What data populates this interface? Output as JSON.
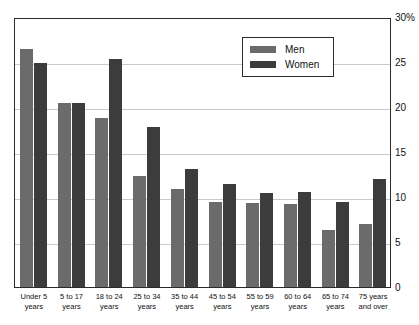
{
  "chart_data": {
    "type": "bar",
    "title": "",
    "xlabel": "",
    "ylabel": "",
    "ylim": [
      0,
      30
    ],
    "grid": true,
    "legend_position": "top-right",
    "axis_side": "right",
    "y_suffix": "%",
    "categories": [
      "Under 5 years",
      "5 to 17 years",
      "18 to 24 years",
      "25 to 34 years",
      "35 to 44 years",
      "45 to 54 years",
      "55 to 59 years",
      "60 to 64 years",
      "65 to 74 years",
      "75 years and over"
    ],
    "category_lines": [
      [
        "Under 5",
        "years"
      ],
      [
        "5 to 17",
        "years"
      ],
      [
        "18 to 24",
        "years"
      ],
      [
        "25 to 34",
        "years"
      ],
      [
        "35 to 44",
        "years"
      ],
      [
        "45 to 54",
        "years"
      ],
      [
        "55 to 59",
        "years"
      ],
      [
        "60 to 64",
        "years"
      ],
      [
        "65 to 74",
        "years"
      ],
      [
        "75 years",
        "and over"
      ]
    ],
    "series": [
      {
        "name": "Men",
        "color": "#6b6b6b",
        "values": [
          26.4,
          20.4,
          18.8,
          12.3,
          10.9,
          9.4,
          9.3,
          9.2,
          6.3,
          7.0
        ]
      },
      {
        "name": "Women",
        "color": "#3c3c3c",
        "values": [
          24.9,
          20.4,
          25.3,
          17.8,
          13.1,
          11.4,
          10.4,
          10.6,
          9.4,
          12.0
        ]
      }
    ],
    "yticks": [
      {
        "value": 30,
        "label": "30%"
      },
      {
        "value": 25,
        "label": "25"
      },
      {
        "value": 20,
        "label": "20"
      },
      {
        "value": 15,
        "label": "15"
      },
      {
        "value": 10,
        "label": "10"
      },
      {
        "value": 5,
        "label": "5"
      },
      {
        "value": 0,
        "label": "0"
      }
    ]
  },
  "legend": {
    "men_label": "Men",
    "women_label": "Women"
  },
  "colors": {
    "men": "#6b6b6b",
    "women": "#3c3c3c",
    "frame": "#2b2b2b",
    "gridline": "#c9c9c9",
    "background": "#ffffff"
  }
}
